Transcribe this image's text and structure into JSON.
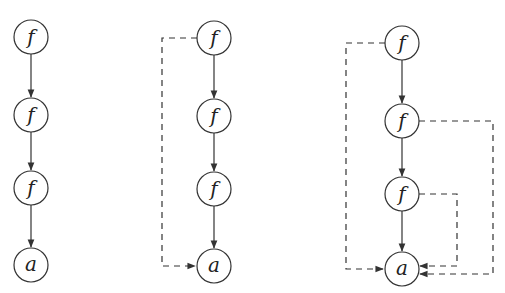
{
  "diagram": {
    "graphs": [
      {
        "id": "chain",
        "nodes": [
          {
            "label": "f",
            "x": 31,
            "y": 37
          },
          {
            "label": "f",
            "x": 31,
            "y": 115
          },
          {
            "label": "f",
            "x": 31,
            "y": 188
          },
          {
            "label": "a",
            "x": 31,
            "y": 265
          }
        ],
        "edges": [
          "0->1 solid",
          "1->2 solid",
          "2->3 solid"
        ]
      },
      {
        "id": "chain-with-one-pointer",
        "nodes": [
          {
            "label": "f",
            "x": 214,
            "y": 38
          },
          {
            "label": "f",
            "x": 214,
            "y": 116
          },
          {
            "label": "f",
            "x": 214,
            "y": 189
          },
          {
            "label": "a",
            "x": 214,
            "y": 266
          }
        ],
        "edges": [
          "0->1 solid",
          "1->2 solid",
          "2->3 solid",
          "0->3 dashed (left)"
        ]
      },
      {
        "id": "chain-with-all-pointers",
        "nodes": [
          {
            "label": "f",
            "x": 402,
            "y": 43
          },
          {
            "label": "f",
            "x": 402,
            "y": 121
          },
          {
            "label": "f",
            "x": 402,
            "y": 194
          },
          {
            "label": "a",
            "x": 402,
            "y": 269
          }
        ],
        "edges": [
          "0->1 solid",
          "1->2 solid",
          "2->3 solid",
          "0->3 dashed (left)",
          "1->3 dashed (right outer)",
          "2->3 dashed (right inner)"
        ]
      }
    ],
    "labels": {
      "g1": [
        "f",
        "f",
        "f",
        "a"
      ],
      "g2": [
        "f",
        "f",
        "f",
        "a"
      ],
      "g3": [
        "f",
        "f",
        "f",
        "a"
      ]
    }
  }
}
